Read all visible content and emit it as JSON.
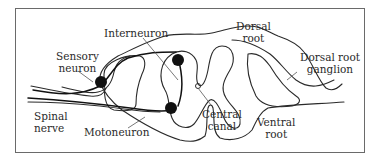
{
  "figure": {
    "type": "anatomical-diagram",
    "colors": {
      "line": "#2a2a2a",
      "leader": "#555555",
      "neuron_body": "#111111",
      "frame": "#6a6a6a",
      "background": "#ffffff"
    }
  },
  "labels": {
    "interneuron": "Interneuron",
    "sensory_neuron_1": "Sensory",
    "sensory_neuron_2": "neuron",
    "spinal_nerve_1": "Spinal",
    "spinal_nerve_2": "nerve",
    "motoneuron": "Motoneuron",
    "dorsal_root_1": "Dorsal",
    "dorsal_root_2": "root",
    "dorsal_root_ganglion_1": "Dorsal root",
    "dorsal_root_ganglion_2": "ganglion",
    "central_canal_1": "Central",
    "central_canal_2": "canal",
    "ventral_root_1": "Ventral",
    "ventral_root_2": "root"
  }
}
